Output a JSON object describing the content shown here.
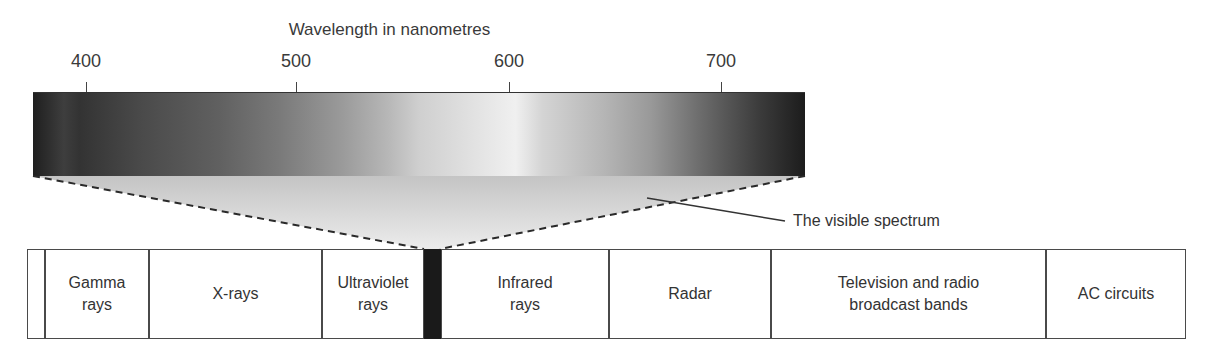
{
  "diagram": {
    "axis": {
      "label": "Wavelength in nanometres",
      "ticks": [
        {
          "value": "400",
          "x": 86
        },
        {
          "value": "500",
          "x": 296
        },
        {
          "value": "600",
          "x": 509
        },
        {
          "value": "700",
          "x": 721
        }
      ]
    },
    "callout": {
      "label": "The visible spectrum"
    },
    "bands": [
      {
        "id": "blank",
        "label": "",
        "left": 0,
        "width": 18
      },
      {
        "id": "gamma",
        "label": "Gamma rays",
        "line1": "Gamma",
        "line2": "rays",
        "left": 18,
        "width": 104
      },
      {
        "id": "xrays",
        "label": "X-rays",
        "line1": "X-rays",
        "line2": "",
        "left": 122,
        "width": 173
      },
      {
        "id": "ultraviolet",
        "label": "Ultraviolet rays",
        "line1": "Ultraviolet",
        "line2": "rays",
        "left": 295,
        "width": 102
      },
      {
        "id": "visible",
        "label": "",
        "left": 397,
        "width": 17
      },
      {
        "id": "infrared",
        "label": "Infrared rays",
        "line1": "Infrared",
        "line2": "rays",
        "left": 414,
        "width": 168
      },
      {
        "id": "radar",
        "label": "Radar",
        "line1": "Radar",
        "line2": "",
        "left": 582,
        "width": 162
      },
      {
        "id": "tv-radio",
        "label": "Television and radio broadcast bands",
        "line1": "Television and radio",
        "line2": "broadcast bands",
        "left": 744,
        "width": 275
      },
      {
        "id": "ac",
        "label": "AC circuits",
        "line1": "AC circuits",
        "line2": "",
        "left": 1019,
        "width": 140
      }
    ],
    "colors": {
      "outline": "#4a4a4a",
      "visible_band": "#1a1a1a",
      "funnel_fill_top": "#c8c8c8",
      "funnel_fill_bottom": "#e6e6e6"
    }
  }
}
